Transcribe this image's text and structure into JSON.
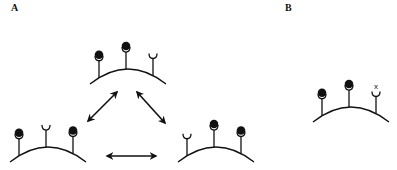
{
  "panels": [
    {
      "label": "A",
      "description": "Three receptor occupancy states interconverting",
      "cells": [
        {
          "id": "top",
          "receptors": [
            "bound",
            "bound",
            "empty"
          ]
        },
        {
          "id": "bottom-left",
          "receptors": [
            "bound",
            "empty",
            "bound"
          ]
        },
        {
          "id": "bottom-right",
          "receptors": [
            "empty",
            "bound",
            "bound"
          ]
        }
      ],
      "arrows": [
        {
          "from": "bottom-left",
          "to": "top",
          "type": "double-headed"
        },
        {
          "from": "top",
          "to": "bottom-right",
          "type": "double-headed"
        },
        {
          "from": "bottom-left",
          "to": "bottom-right",
          "type": "double-headed"
        }
      ]
    },
    {
      "label": "B",
      "description": "Receptor state with one blocked site",
      "cells": [
        {
          "id": "b-cell",
          "receptors": [
            "bound",
            "bound",
            "blocked"
          ]
        }
      ],
      "blocked_marker": "x"
    }
  ],
  "colors": {
    "ink": "#111111",
    "background": "#ffffff"
  }
}
